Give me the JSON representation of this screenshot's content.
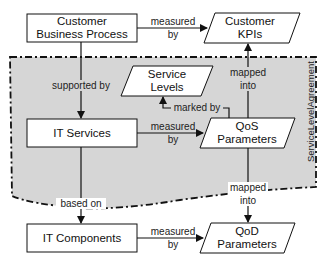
{
  "diagram": {
    "region": {
      "label": "ServiceLevelAgreement",
      "fill": "#d6d6d6"
    },
    "nodes": {
      "cbp": {
        "line1": "Customer",
        "line2": "Business Process",
        "shape": "rectangle"
      },
      "ckpi": {
        "line1": "Customer",
        "line2": "KPIs",
        "shape": "parallelogram"
      },
      "sl": {
        "line1": "Service",
        "line2": "Levels",
        "shape": "parallelogram"
      },
      "its": {
        "line1": "IT Services",
        "shape": "rectangle"
      },
      "qos": {
        "line1": "QoS",
        "line2": "Parameters",
        "shape": "parallelogram"
      },
      "itc": {
        "line1": "IT Components",
        "shape": "rectangle"
      },
      "qod": {
        "line1": "QoD",
        "line2": "Parameters",
        "shape": "parallelogram"
      }
    },
    "edges": {
      "cbp_ckpi": {
        "line1": "measured",
        "line2": "by"
      },
      "cbp_its": {
        "line1": "supported by"
      },
      "qos_ckpi": {
        "line1": "mapped",
        "line2": "into"
      },
      "qos_sl": {
        "line1": "marked by"
      },
      "its_qos": {
        "line1": "measured",
        "line2": "by"
      },
      "qos_qod": {
        "line1": "mapped",
        "line2": "into"
      },
      "its_itc": {
        "line1": "based on"
      },
      "itc_qod": {
        "line1": "measured",
        "line2": "by"
      }
    }
  }
}
